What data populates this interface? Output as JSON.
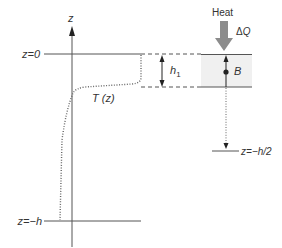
{
  "diagram": {
    "axis_label": "z",
    "surface_label": "z=0",
    "bottom_label": "z=−h",
    "mid_label": "z=−h/2",
    "curve_label": "T (z)",
    "layer_thickness_label": "h",
    "layer_thickness_sub": "1",
    "heat_label": "Heat",
    "heat_delta_label": "ΔQ",
    "point_label": "B",
    "colors": {
      "line": "#555555",
      "dotted": "#666666",
      "box_fill": "#f0f0f0",
      "heat_arrow": "#8c8c8c",
      "text": "#333333"
    }
  }
}
